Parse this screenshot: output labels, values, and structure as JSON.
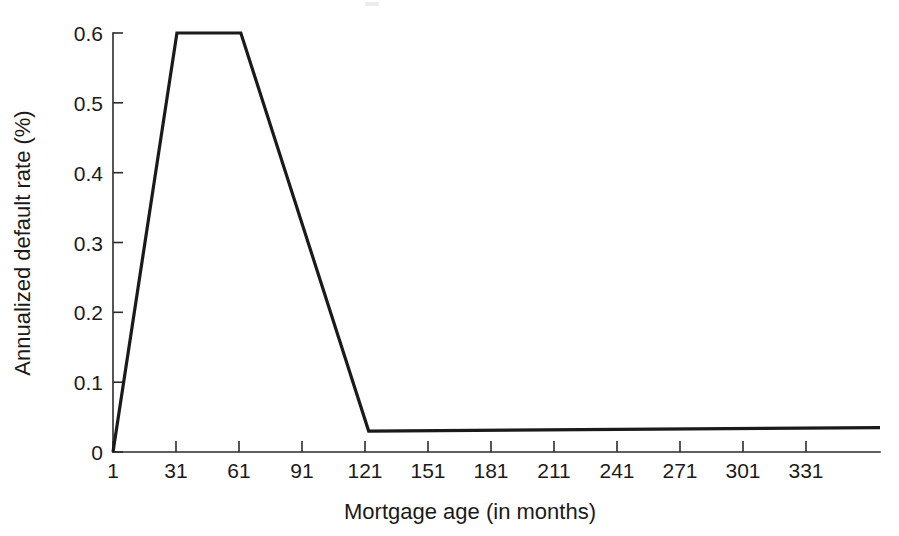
{
  "figure": {
    "background_color": "#ffffff",
    "line_color": "#1a1a1a",
    "axis_color": "#2b2b2b"
  },
  "chart_data": {
    "type": "line",
    "title": "",
    "subtitle": "",
    "xlabel": "Mortgage age (in months)",
    "ylabel": "Annualized default rate (%)",
    "xlim": [
      1,
      361
    ],
    "ylim": [
      0,
      0.6
    ],
    "grid": false,
    "legend": null,
    "x_tick_labels": [
      "1",
      "31",
      "61",
      "91",
      "121",
      "151",
      "181",
      "211",
      "241",
      "271",
      "301",
      "331"
    ],
    "x_tick_values": [
      1,
      31,
      61,
      91,
      121,
      151,
      181,
      211,
      241,
      271,
      301,
      331
    ],
    "y_tick_labels": [
      "0",
      "0.1",
      "0.2",
      "0.3",
      "0.4",
      "0.5",
      "0.6"
    ],
    "y_tick_values": [
      0,
      0.1,
      0.2,
      0.3,
      0.4,
      0.5,
      0.6
    ],
    "series": [
      {
        "name": "Annualized default rate",
        "x": [
          1,
          31,
          61,
          121,
          361
        ],
        "values": [
          0,
          0.6,
          0.6,
          0.03,
          0.035
        ]
      }
    ],
    "annotations": []
  }
}
